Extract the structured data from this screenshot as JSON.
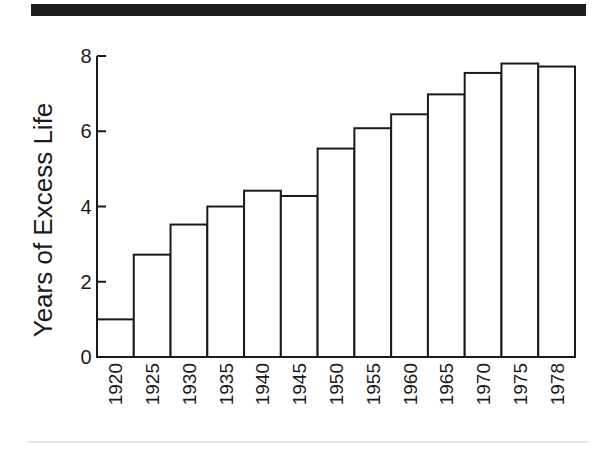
{
  "chart_data": {
    "type": "bar",
    "title": "",
    "xlabel": "",
    "ylabel": "Years of Excess Life",
    "categories": [
      "1920",
      "1925",
      "1930",
      "1935",
      "1940",
      "1945",
      "1950",
      "1955",
      "1960",
      "1965",
      "1970",
      "1975",
      "1978"
    ],
    "values": [
      1.0,
      2.72,
      3.52,
      4.0,
      4.42,
      4.28,
      5.54,
      6.08,
      6.45,
      6.98,
      7.55,
      7.8,
      7.72
    ],
    "ylim": [
      0,
      8
    ],
    "yticks": [
      0,
      2,
      4,
      6,
      8
    ],
    "grid": false,
    "legend": null,
    "bar_style": {
      "fill": "#ffffff",
      "stroke": "#1a1a1a"
    },
    "x_tick_rotation": -90
  },
  "decorations": {
    "top_band_color": "#1e1e1e",
    "bottom_rule_color": "#e6e6e6"
  }
}
